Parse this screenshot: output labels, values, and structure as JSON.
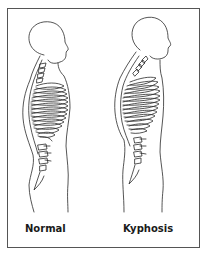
{
  "figure": {
    "labels": {
      "normal": "Normal",
      "kyphosis": "Kyphosis"
    },
    "colors": {
      "line": "#2a2a2a",
      "border": "#555555",
      "background": "#ffffff"
    }
  }
}
